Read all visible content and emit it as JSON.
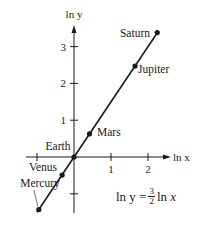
{
  "chart_data": {
    "type": "scatter",
    "title": "",
    "xlabel": "ln x",
    "ylabel": "ln y",
    "x_ticks": [
      -1,
      1,
      2
    ],
    "x_tick_labels": [
      "",
      "1",
      "2"
    ],
    "y_ticks": [
      -1,
      1,
      2,
      3
    ],
    "y_tick_labels": [
      "",
      "1",
      "2",
      "3"
    ],
    "xlim": [
      -1.05,
      2.6
    ],
    "ylim": [
      -1.5,
      3.6
    ],
    "grid": false,
    "legend": null,
    "series": [
      {
        "name": "Planets",
        "points": [
          {
            "label": "Mercury",
            "x": -0.95,
            "y": -1.43
          },
          {
            "label": "Venus",
            "x": -0.32,
            "y": -0.49
          },
          {
            "label": "Earth",
            "x": 0.0,
            "y": 0.0
          },
          {
            "label": "Mars",
            "x": 0.42,
            "y": 0.63
          },
          {
            "label": "Jupiter",
            "x": 1.65,
            "y": 2.47
          },
          {
            "label": "Saturn",
            "x": 2.25,
            "y": 3.38
          }
        ]
      }
    ],
    "fit_line": {
      "slope": 1.5,
      "intercept": 0,
      "x_range": [
        -1.0,
        2.27
      ]
    },
    "annotation": {
      "lhs": "ln y =",
      "frac_num": "3",
      "frac_den": "2",
      "rhs": "ln x"
    }
  },
  "colors": {
    "ink": "#1a1a1a",
    "background": "#ffffff"
  }
}
